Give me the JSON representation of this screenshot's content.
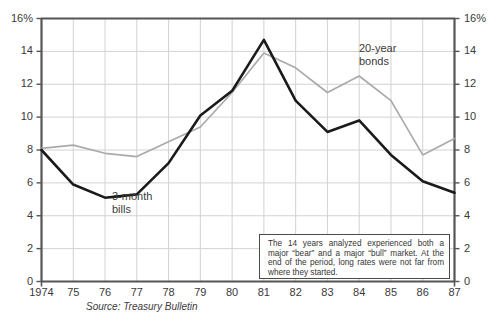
{
  "chart_data": {
    "type": "line",
    "title": "",
    "subtitle": "",
    "xlabel": "",
    "ylabel": "",
    "ylim": [
      0,
      16
    ],
    "yticks": [
      0,
      2,
      4,
      6,
      8,
      10,
      12,
      14,
      16
    ],
    "ytick_labels_left": [
      "0",
      "2",
      "4",
      "6",
      "8",
      "10",
      "12",
      "14",
      "16%"
    ],
    "ytick_labels_right": [
      "0",
      "2",
      "4",
      "6",
      "8",
      "10",
      "12",
      "14",
      "16%"
    ],
    "grid": true,
    "legend_position": "inline-annotations",
    "categories": [
      "1974",
      "75",
      "76",
      "77",
      "78",
      "79",
      "80",
      "81",
      "82",
      "83",
      "84",
      "85",
      "86",
      "87"
    ],
    "x": [
      1974,
      1975,
      1976,
      1977,
      1978,
      1979,
      1980,
      1981,
      1982,
      1983,
      1984,
      1985,
      1986,
      1987
    ],
    "series": [
      {
        "name": "3-month bills",
        "color": "#1a1a1a",
        "line_width": 2.6,
        "values": [
          8.0,
          5.9,
          5.1,
          5.3,
          7.2,
          10.1,
          11.6,
          14.7,
          11.0,
          9.1,
          9.8,
          7.7,
          6.1,
          5.4
        ]
      },
      {
        "name": "20-year bonds",
        "color": "#aaaaaa",
        "line_width": 1.7,
        "values": [
          8.1,
          8.3,
          7.8,
          7.6,
          8.5,
          9.4,
          11.5,
          13.9,
          13.0,
          11.5,
          12.5,
          11.0,
          7.7,
          8.7
        ]
      }
    ],
    "annotations": [
      {
        "id": "bills-label",
        "text": "3-month\nbills",
        "x_px": 112,
        "y_px": 190
      },
      {
        "id": "bonds-label",
        "text": "20-year\nbonds",
        "x_px": 359,
        "y_px": 42
      }
    ],
    "callout": {
      "text": "The 14 years analyzed experienced both a major “bear” and a major “bull” market. At the end of the period, long rates were not far from where they started."
    },
    "source": "Source: Treasury Bulletin"
  }
}
